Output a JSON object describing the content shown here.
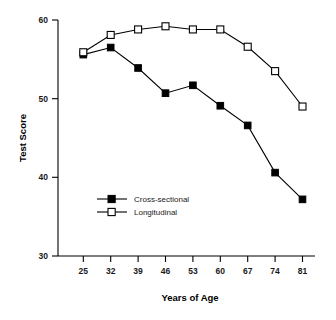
{
  "chart_data": {
    "type": "line",
    "title": "",
    "xlabel": "Years of Age",
    "ylabel": "Test Score",
    "categories": [
      25,
      32,
      39,
      46,
      53,
      60,
      67,
      74,
      81
    ],
    "xticklabels": [
      "25",
      "32",
      "39",
      "46",
      "53",
      "60",
      "67",
      "74",
      "81"
    ],
    "yticklabels": [
      "30",
      "40",
      "50",
      "60"
    ],
    "yticks": [
      30,
      40,
      50,
      60
    ],
    "ylim": [
      30,
      60
    ],
    "grid": false,
    "legend_position": "center-left-inside",
    "series": [
      {
        "name": "Cross-sectional",
        "marker": "filled-square",
        "values": [
          55.6,
          56.5,
          53.9,
          50.7,
          51.7,
          49.1,
          46.6,
          40.6,
          37.2
        ]
      },
      {
        "name": "Longitudinal",
        "marker": "open-square",
        "values": [
          55.9,
          58.1,
          58.8,
          59.2,
          58.8,
          58.8,
          56.6,
          53.5,
          49.0
        ]
      }
    ],
    "colors": {
      "line": "#000000",
      "filled_marker": "#000000",
      "open_marker": "#ffffff",
      "background": "#ffffff",
      "text": "#000000"
    }
  },
  "legend": {
    "items": [
      {
        "label": "Cross-sectional",
        "marker": "filled-square"
      },
      {
        "label": "Longitudinal",
        "marker": "open-square"
      }
    ]
  }
}
